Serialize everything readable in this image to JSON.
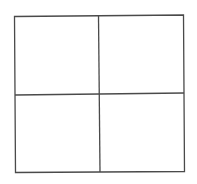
{
  "diagram": {
    "type": "grid",
    "rows": 2,
    "columns": 2,
    "cells": [
      {
        "row": 0,
        "col": 0,
        "label": ""
      },
      {
        "row": 0,
        "col": 1,
        "label": ""
      },
      {
        "row": 1,
        "col": 0,
        "label": ""
      },
      {
        "row": 1,
        "col": 1,
        "label": ""
      }
    ],
    "line_color": "#4a4a4a",
    "background_color": "#ffffff"
  }
}
